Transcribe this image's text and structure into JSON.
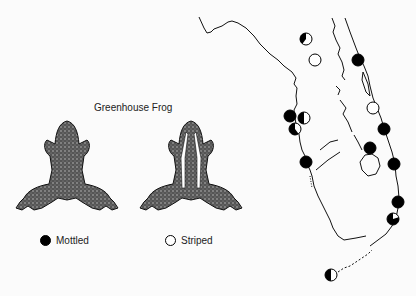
{
  "title": "Greenhouse Frog",
  "legend": [
    {
      "label": "Mottled",
      "marker": "filled",
      "color": "#000000"
    },
    {
      "label": "Striped",
      "marker": "open",
      "color": "#ffffff"
    }
  ],
  "frogs": [
    {
      "name": "mottled-frog",
      "pattern": "mottled"
    },
    {
      "name": "striped-frog",
      "pattern": "striped"
    }
  ],
  "map": {
    "region": "Florida",
    "sites": [
      {
        "x": 306,
        "y": 39,
        "type": "mixed",
        "fraction_mottled": 0.4
      },
      {
        "x": 315,
        "y": 60,
        "type": "striped"
      },
      {
        "x": 358,
        "y": 60,
        "type": "mottled"
      },
      {
        "x": 373,
        "y": 108,
        "type": "striped"
      },
      {
        "x": 290,
        "y": 116,
        "type": "mottled"
      },
      {
        "x": 304,
        "y": 118,
        "type": "mixed",
        "fraction_mottled": 0.5
      },
      {
        "x": 295,
        "y": 129,
        "type": "mixed",
        "fraction_mottled": 0.6
      },
      {
        "x": 384,
        "y": 129,
        "type": "mottled"
      },
      {
        "x": 370,
        "y": 148,
        "type": "mottled"
      },
      {
        "x": 306,
        "y": 162,
        "type": "mottled"
      },
      {
        "x": 394,
        "y": 164,
        "type": "mottled"
      },
      {
        "x": 398,
        "y": 202,
        "type": "mottled"
      },
      {
        "x": 393,
        "y": 219,
        "type": "mixed",
        "fraction_mottled": 0.8
      },
      {
        "x": 331,
        "y": 275,
        "type": "mixed",
        "fraction_mottled": 0.5
      }
    ]
  }
}
